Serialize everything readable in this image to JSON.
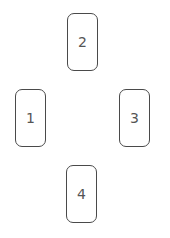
{
  "diagram": {
    "type": "card-spread",
    "cards": [
      {
        "label": "1",
        "position": "left"
      },
      {
        "label": "2",
        "position": "top"
      },
      {
        "label": "3",
        "position": "right"
      },
      {
        "label": "4",
        "position": "bottom"
      }
    ]
  }
}
